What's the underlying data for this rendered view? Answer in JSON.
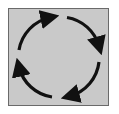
{
  "diagram": {
    "type": "cycle",
    "direction": "clockwise",
    "arrow_count": 4,
    "colors": {
      "background": "#c9c9c9",
      "border": "#6a6a6a",
      "arrow": "#111111"
    }
  }
}
